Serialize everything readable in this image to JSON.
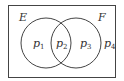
{
  "diagram": {
    "type": "venn",
    "universe_color": "#444444",
    "sets": [
      {
        "label": "E",
        "cx": 46,
        "cy": 43,
        "r": 25
      },
      {
        "label": "F",
        "cx": 76,
        "cy": 43,
        "r": 25
      }
    ],
    "regions": [
      {
        "label": "p",
        "sub": "1",
        "x": 33,
        "y": 47
      },
      {
        "label": "p",
        "sub": "2",
        "x": 57,
        "y": 47
      },
      {
        "label": "p",
        "sub": "3",
        "x": 80,
        "y": 47
      },
      {
        "label": "p",
        "sub": "4",
        "x": 105,
        "y": 47
      }
    ]
  }
}
